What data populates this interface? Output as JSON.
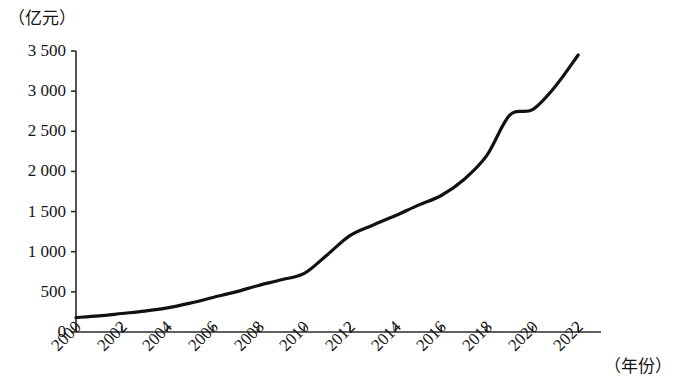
{
  "chart_data": {
    "type": "line",
    "title": "",
    "subtitle": "",
    "xlabel": "（年份）",
    "ylabel": "（亿元）",
    "x": [
      2000,
      2001,
      2002,
      2003,
      2004,
      2005,
      2006,
      2007,
      2008,
      2009,
      2010,
      2011,
      2012,
      2013,
      2014,
      2015,
      2016,
      2017,
      2018,
      2019,
      2020,
      2021,
      2022
    ],
    "values": [
      180,
      200,
      230,
      260,
      300,
      360,
      430,
      500,
      580,
      650,
      730,
      960,
      1200,
      1330,
      1450,
      1580,
      1700,
      1900,
      2200,
      2700,
      2770,
      3060,
      3450
    ],
    "series": [
      {
        "name": "数值",
        "values": [
          180,
          200,
          230,
          260,
          300,
          360,
          430,
          500,
          580,
          650,
          730,
          960,
          1200,
          1330,
          1450,
          1580,
          1700,
          1900,
          2200,
          2700,
          2770,
          3060,
          3450
        ]
      }
    ],
    "x_tick_labels": [
      "2000",
      "2002",
      "2004",
      "2006",
      "2008",
      "2010",
      "2012",
      "2014",
      "2016",
      "2018",
      "2020",
      "2022"
    ],
    "x_tick_values": [
      2000,
      2002,
      2004,
      2006,
      2008,
      2010,
      2012,
      2014,
      2016,
      2018,
      2020,
      2022
    ],
    "y_tick_labels": [
      "0",
      "500",
      "1 000",
      "1 500",
      "2 000",
      "2 500",
      "3 000",
      "3 500"
    ],
    "y_tick_values": [
      0,
      500,
      1000,
      1500,
      2000,
      2500,
      3000,
      3500
    ],
    "xlim": [
      2000,
      2023
    ],
    "ylim": [
      0,
      3500
    ],
    "grid": false,
    "legend": false,
    "legend_position": "none",
    "line_color": "#111111",
    "line_width": 3,
    "axis_color": "#2b2b2b",
    "background_color": "#ffffff"
  },
  "axes": {
    "y_unit": "（亿元）",
    "x_unit": "（年份）"
  }
}
